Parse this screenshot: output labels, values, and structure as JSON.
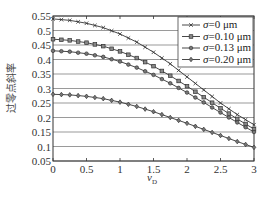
{
  "chart_data": {
    "type": "line",
    "title": "",
    "xlabel": "v_D",
    "xlabel_main": "v",
    "xlabel_sub": "D",
    "ylabel": "过零点斜率",
    "xlim": [
      0,
      3
    ],
    "ylim": [
      0.05,
      0.55
    ],
    "xticks": [
      "0",
      "0.5",
      "1",
      "1.5",
      "2",
      "2.5",
      "3"
    ],
    "yticks": [
      "0.55",
      "0.5",
      "0.45",
      "0.4",
      "0.35",
      "0.3",
      "0.25",
      "0.2",
      "0.15",
      "0.1",
      "0.05"
    ],
    "grid": true,
    "legend_position": "upper right",
    "x": [
      0,
      0.25,
      0.5,
      0.75,
      1.0,
      1.25,
      1.5,
      1.75,
      2.0,
      2.25,
      2.5,
      2.75,
      3.0
    ],
    "series": [
      {
        "name": "σ=0 μm",
        "marker": "x",
        "values": [
          0.54,
          0.535,
          0.525,
          0.51,
          0.488,
          0.46,
          0.425,
          0.385,
          0.34,
          0.295,
          0.25,
          0.21,
          0.175
        ]
      },
      {
        "name": "σ=0.10 μm",
        "marker": "square",
        "values": [
          0.47,
          0.466,
          0.458,
          0.446,
          0.428,
          0.405,
          0.377,
          0.344,
          0.308,
          0.27,
          0.232,
          0.195,
          0.16
        ]
      },
      {
        "name": "σ=0.13 μm",
        "marker": "circle",
        "values": [
          0.43,
          0.427,
          0.42,
          0.409,
          0.393,
          0.372,
          0.347,
          0.318,
          0.286,
          0.252,
          0.217,
          0.183,
          0.15
        ]
      },
      {
        "name": "σ=0.20 μm",
        "marker": "diamond",
        "values": [
          0.28,
          0.278,
          0.273,
          0.265,
          0.253,
          0.238,
          0.22,
          0.2,
          0.18,
          0.159,
          0.138,
          0.117,
          0.097
        ]
      }
    ]
  },
  "legend": {
    "items": [
      {
        "sigma": "σ",
        "label": "=0 μm"
      },
      {
        "sigma": "σ",
        "label": "=0.10 μm"
      },
      {
        "sigma": "σ",
        "label": "=0.13 μm"
      },
      {
        "sigma": "σ",
        "label": "=0.20 μm"
      }
    ]
  }
}
